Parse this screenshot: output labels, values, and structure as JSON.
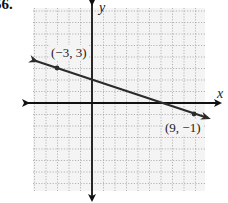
{
  "problem": {
    "number": "56."
  },
  "chart_data": {
    "type": "line",
    "title": "",
    "xlabel": "x",
    "ylabel": "y",
    "xlim": [
      -5,
      10
    ],
    "ylim": [
      -8,
      8
    ],
    "grid": true,
    "grid_style": "dotted",
    "legend": null,
    "series": [
      {
        "name": "line through (-3, 3) and (9, -1)",
        "kind": "infinite-line",
        "slope": -0.3333,
        "y_intercept": 2,
        "points": [
          {
            "x": -3,
            "y": 3,
            "label": "(−3, 3)"
          },
          {
            "x": 9,
            "y": -1,
            "label": "(9, −1)"
          }
        ]
      }
    ],
    "annotations": [
      "(−3, 3)",
      "(9, −1)"
    ]
  },
  "labels": {
    "x_axis": "x",
    "y_axis": "y",
    "point_a": "(−3, 3)",
    "point_b": "(9, −1)"
  },
  "colors": {
    "grid": "#9a9a9a",
    "axis": "#111111",
    "line": "#2b2b2b",
    "background": "#f4f4f4"
  }
}
